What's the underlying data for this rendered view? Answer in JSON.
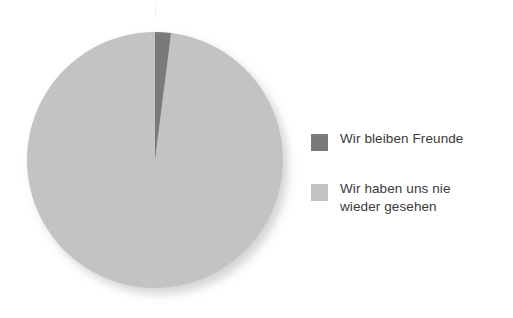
{
  "chart_data": {
    "type": "pie",
    "title": "",
    "categories": [
      "Wir bleiben Freunde",
      "Wir haben uns nie wieder gesehen"
    ],
    "values": [
      2,
      98
    ],
    "unit": "%",
    "colors": [
      "#7a7a7a",
      "#c3c3c3"
    ],
    "start_angle_deg": 0,
    "direction": "clockwise",
    "legend": {
      "position": "right",
      "entries": [
        {
          "label": "Wir bleiben Freunde",
          "color": "#7a7a7a",
          "value": 2
        },
        {
          "label": "Wir haben uns nie\nwieder gesehen",
          "color": "#c3c3c3",
          "value": 98
        }
      ]
    },
    "grid": false,
    "xlabel": "",
    "ylabel": ""
  },
  "canvas": {
    "background": "#ffffff",
    "pie": {
      "center_x": 155,
      "center_y": 160,
      "radius": 128,
      "shadow": true
    }
  }
}
